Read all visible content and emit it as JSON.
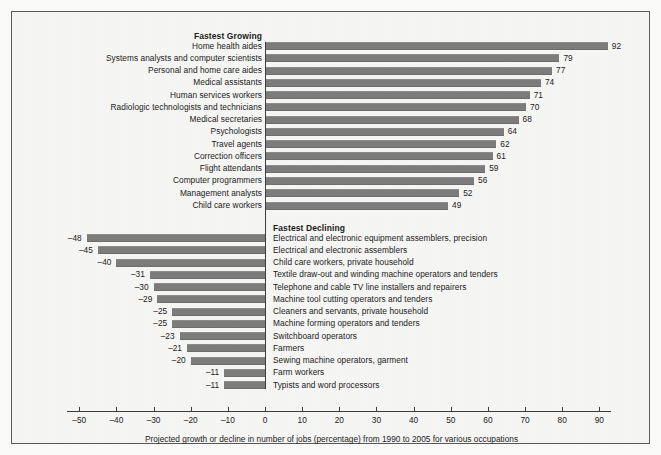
{
  "chart_data": {
    "type": "bar",
    "orientation": "horizontal",
    "title": "",
    "caption": "Projected growth or decline in number of jobs (percentage) from 1990 to 2005 for various occupations",
    "xlabel": "",
    "ylabel": "",
    "xlim": [
      -55,
      95
    ],
    "grid": false,
    "legend": "none",
    "xticks": [
      -50,
      -40,
      -30,
      -20,
      -10,
      0,
      10,
      20,
      30,
      40,
      50,
      60,
      70,
      80,
      90
    ],
    "xtick_labels": [
      "–50",
      "–40",
      "–30",
      "–20",
      "–10",
      "0",
      "10",
      "20",
      "30",
      "40",
      "50",
      "60",
      "70",
      "80",
      "90"
    ],
    "groups": [
      {
        "name": "fastest_growing",
        "heading": "Fastest Growing",
        "label_side": "left",
        "categories": [
          "Home health aides",
          "Systems analysts and computer scientists",
          "Personal and home care aides",
          "Medical assistants",
          "Human services workers",
          "Radiologic technologists and technicians",
          "Medical secretaries",
          "Psychologists",
          "Travel agents",
          "Correction officers",
          "Flight attendants",
          "Computer programmers",
          "Management analysts",
          "Child care workers"
        ],
        "values": [
          92,
          79,
          77,
          74,
          71,
          70,
          68,
          64,
          62,
          61,
          59,
          56,
          52,
          49
        ],
        "value_labels": [
          "92",
          "79",
          "77",
          "74",
          "71",
          "70",
          "68",
          "64",
          "62",
          "61",
          "59",
          "56",
          "52",
          "49"
        ]
      },
      {
        "name": "fastest_declining",
        "heading": "Fastest Declining",
        "label_side": "right",
        "categories": [
          "Electrical and electronic equipment assemblers, precision",
          "Electrical and electronic assemblers",
          "Child care workers, private household",
          "Textile draw-out and winding machine operators and tenders",
          "Telephone and cable TV line installers and repairers",
          "Machine tool cutting operators and tenders",
          "Cleaners and servants, private household",
          "Machine forming operators and tenders",
          "Switchboard operators",
          "Farmers",
          "Sewing machine operators, garment",
          "Farm workers",
          "Typists and word processors"
        ],
        "values": [
          -48,
          -45,
          -40,
          -31,
          -30,
          -29,
          -25,
          -25,
          -23,
          -21,
          -20,
          -11,
          -11
        ],
        "value_labels": [
          "–48",
          "–45",
          "–40",
          "–31",
          "–30",
          "–29",
          "–25",
          "–25",
          "–23",
          "–21",
          "–20",
          "–11",
          "–11"
        ]
      }
    ],
    "colors": {
      "bar": "#7d7d7d",
      "axis": "#3d3d3d",
      "text": "#1b1b1b",
      "background": "#f7f7f5",
      "border": "#5a5a5a"
    }
  }
}
